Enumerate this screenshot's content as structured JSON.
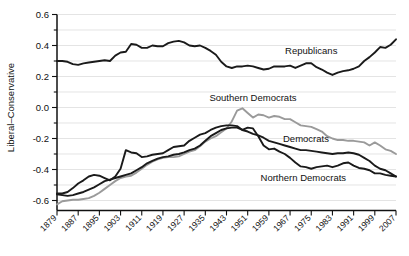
{
  "chart_data": {
    "type": "line",
    "title": "",
    "xlabel": "",
    "ylabel": "Liberal–Conservative",
    "xlim": [
      1879,
      2007
    ],
    "ylim": [
      -0.6,
      0.6
    ],
    "grid": true,
    "legend_position": "inline-annotations",
    "x_ticks": [
      "1879",
      "1887",
      "1895",
      "1903",
      "1911",
      "1919",
      "1927",
      "1935",
      "1943",
      "1951",
      "1959",
      "1967",
      "1975",
      "1983",
      "1991",
      "1999",
      "2007"
    ],
    "y_ticks": [
      "0.6",
      "0.4",
      "0.2",
      "0.0",
      "-0.2",
      "-0.4",
      "-0.6"
    ],
    "y_tick_values": [
      0.6,
      0.4,
      0.2,
      0.0,
      -0.2,
      -0.4,
      -0.6
    ],
    "minor_gridline_values": [
      0.5,
      0.3,
      0.1,
      -0.1,
      -0.3,
      -0.5
    ],
    "x": [
      1879,
      1881,
      1883,
      1885,
      1887,
      1889,
      1891,
      1893,
      1895,
      1897,
      1899,
      1901,
      1903,
      1905,
      1907,
      1909,
      1911,
      1913,
      1915,
      1917,
      1919,
      1921,
      1923,
      1925,
      1927,
      1929,
      1931,
      1933,
      1935,
      1937,
      1939,
      1941,
      1943,
      1945,
      1947,
      1949,
      1951,
      1953,
      1955,
      1957,
      1959,
      1961,
      1963,
      1965,
      1967,
      1969,
      1971,
      1973,
      1975,
      1977,
      1979,
      1981,
      1983,
      1985,
      1987,
      1989,
      1991,
      1993,
      1995,
      1997,
      1999,
      2001,
      2003,
      2005,
      2007
    ],
    "series": [
      {
        "name": "Republicans",
        "color": "#1a1a1a",
        "width": 1.9,
        "label_x": 1975,
        "label_y": 0.345,
        "values": [
          0.3,
          0.3,
          0.295,
          0.28,
          0.275,
          0.285,
          0.29,
          0.295,
          0.3,
          0.305,
          0.3,
          0.335,
          0.355,
          0.36,
          0.41,
          0.405,
          0.385,
          0.385,
          0.4,
          0.395,
          0.395,
          0.415,
          0.425,
          0.43,
          0.42,
          0.4,
          0.395,
          0.4,
          0.385,
          0.365,
          0.34,
          0.295,
          0.265,
          0.255,
          0.265,
          0.265,
          0.27,
          0.265,
          0.255,
          0.245,
          0.25,
          0.265,
          0.265,
          0.265,
          0.27,
          0.255,
          0.27,
          0.285,
          0.285,
          0.26,
          0.245,
          0.225,
          0.21,
          0.225,
          0.235,
          0.24,
          0.25,
          0.265,
          0.3,
          0.325,
          0.355,
          0.39,
          0.385,
          0.405,
          0.44
        ]
      },
      {
        "name": "Southern Democrats",
        "color": "#9a9a9a",
        "width": 1.9,
        "label_x": 1953,
        "label_y": 0.045,
        "values": [
          -0.625,
          -0.605,
          -0.6,
          -0.595,
          -0.595,
          -0.59,
          -0.585,
          -0.57,
          -0.55,
          -0.525,
          -0.5,
          -0.475,
          -0.455,
          -0.445,
          -0.44,
          -0.42,
          -0.395,
          -0.37,
          -0.35,
          -0.335,
          -0.325,
          -0.32,
          -0.32,
          -0.315,
          -0.3,
          -0.285,
          -0.275,
          -0.25,
          -0.22,
          -0.2,
          -0.185,
          -0.16,
          -0.135,
          -0.09,
          -0.02,
          -0.005,
          -0.035,
          -0.065,
          -0.045,
          -0.05,
          -0.065,
          -0.055,
          -0.06,
          -0.075,
          -0.075,
          -0.095,
          -0.115,
          -0.12,
          -0.125,
          -0.14,
          -0.155,
          -0.185,
          -0.2,
          -0.21,
          -0.21,
          -0.215,
          -0.215,
          -0.22,
          -0.225,
          -0.245,
          -0.225,
          -0.245,
          -0.27,
          -0.28,
          -0.3
        ]
      },
      {
        "name": "Democrats",
        "color": "#1a1a1a",
        "width": 1.9,
        "label_x": 1973,
        "label_y": -0.225,
        "values": [
          -0.56,
          -0.565,
          -0.57,
          -0.565,
          -0.555,
          -0.545,
          -0.53,
          -0.515,
          -0.495,
          -0.475,
          -0.465,
          -0.455,
          -0.445,
          -0.435,
          -0.425,
          -0.405,
          -0.385,
          -0.36,
          -0.345,
          -0.33,
          -0.32,
          -0.315,
          -0.305,
          -0.3,
          -0.29,
          -0.275,
          -0.265,
          -0.245,
          -0.215,
          -0.185,
          -0.165,
          -0.145,
          -0.135,
          -0.13,
          -0.13,
          -0.145,
          -0.155,
          -0.17,
          -0.18,
          -0.195,
          -0.215,
          -0.225,
          -0.235,
          -0.245,
          -0.255,
          -0.265,
          -0.275,
          -0.275,
          -0.28,
          -0.285,
          -0.29,
          -0.295,
          -0.3,
          -0.295,
          -0.295,
          -0.29,
          -0.295,
          -0.305,
          -0.325,
          -0.345,
          -0.375,
          -0.395,
          -0.405,
          -0.425,
          -0.445
        ]
      },
      {
        "name": "Northern Democrats",
        "color": "#1a1a1a",
        "width": 1.9,
        "label_x": 1972,
        "label_y": -0.475,
        "values": [
          -0.555,
          -0.555,
          -0.545,
          -0.52,
          -0.49,
          -0.47,
          -0.445,
          -0.435,
          -0.44,
          -0.455,
          -0.47,
          -0.445,
          -0.395,
          -0.275,
          -0.29,
          -0.295,
          -0.32,
          -0.315,
          -0.305,
          -0.3,
          -0.295,
          -0.275,
          -0.255,
          -0.25,
          -0.245,
          -0.215,
          -0.195,
          -0.175,
          -0.165,
          -0.145,
          -0.13,
          -0.12,
          -0.115,
          -0.115,
          -0.12,
          -0.145,
          -0.13,
          -0.135,
          -0.185,
          -0.245,
          -0.27,
          -0.265,
          -0.285,
          -0.3,
          -0.325,
          -0.355,
          -0.38,
          -0.385,
          -0.395,
          -0.385,
          -0.38,
          -0.375,
          -0.385,
          -0.375,
          -0.36,
          -0.355,
          -0.375,
          -0.39,
          -0.395,
          -0.405,
          -0.425,
          -0.425,
          -0.435,
          -0.44,
          -0.445
        ]
      }
    ]
  }
}
